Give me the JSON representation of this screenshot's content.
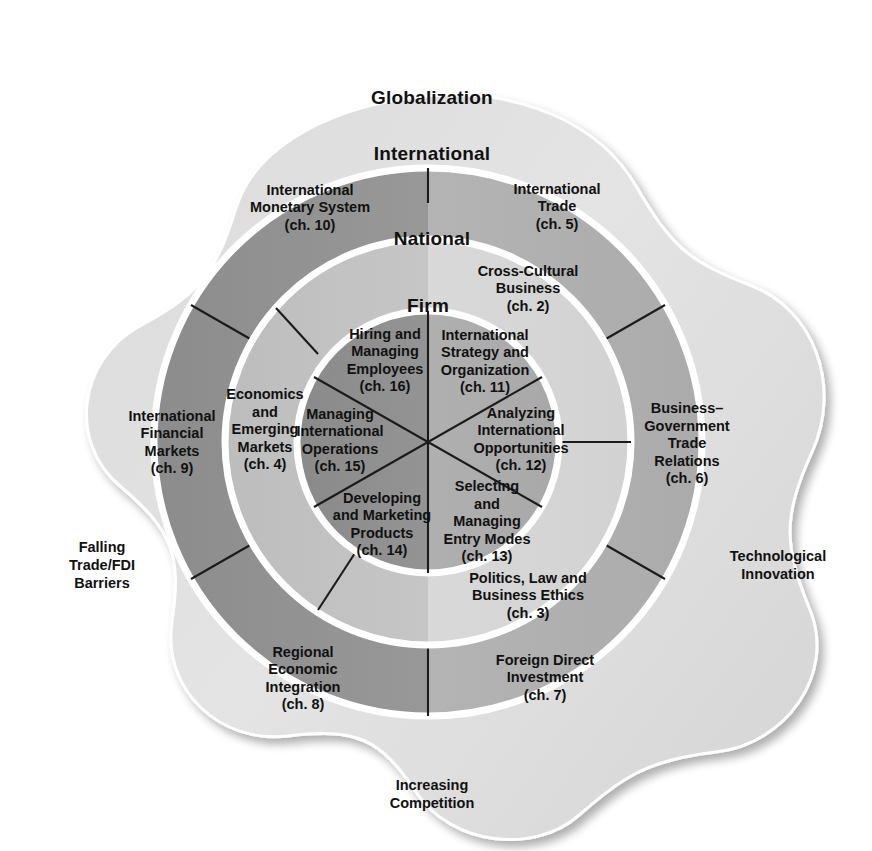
{
  "diagram": {
    "center": {
      "x": 428,
      "y": 442
    },
    "colors": {
      "background": "#ffffff",
      "outer_blob_light": "#e2e2e2",
      "outer_blob_dark": "#d2d2d2",
      "international_light": "#b6b6b6",
      "international_dark": "#8f8f8f",
      "national_light": "#d8d8d8",
      "national_dark": "#b9b9b9",
      "firm_light": "#b0b0b0",
      "firm_dark": "#8b8b8b",
      "divider": "#1b1b1b",
      "ring_edge": "#ffffff",
      "text": "#111111"
    },
    "radii": {
      "firm": 131,
      "national": 203,
      "international": 274,
      "blob": 345
    }
  },
  "ring_titles": [
    {
      "id": "globalization",
      "label": "Globalization",
      "x": 432,
      "y": 99
    },
    {
      "id": "international",
      "label": "International",
      "x": 432,
      "y": 155
    },
    {
      "id": "national",
      "label": "National",
      "x": 432,
      "y": 240
    },
    {
      "id": "firm",
      "label": "Firm",
      "x": 428,
      "y": 307
    }
  ],
  "outer_labels": [
    {
      "id": "falling-trade-fdi-barriers",
      "lines": [
        "Falling",
        "Trade/FDI",
        "Barriers"
      ],
      "x": 102,
      "y": 566
    },
    {
      "id": "technological-innovation",
      "lines": [
        "Technological",
        "Innovation"
      ],
      "x": 778,
      "y": 566
    },
    {
      "id": "increasing-competition",
      "lines": [
        "Increasing",
        "Competition"
      ],
      "x": 432,
      "y": 795
    }
  ],
  "rings": [
    {
      "id": "international-ring",
      "name": "International",
      "segments": [
        {
          "id": "international-monetary-system",
          "lines": [
            "International",
            "Monetary System",
            "(ch. 10)"
          ],
          "chapter": "ch. 10",
          "x": 310,
          "y": 208
        },
        {
          "id": "international-trade",
          "lines": [
            "International",
            "Trade",
            "(ch. 5)"
          ],
          "chapter": "ch. 5",
          "x": 557,
          "y": 207
        },
        {
          "id": "international-financial-markets",
          "lines": [
            "International",
            "Financial",
            "Markets",
            "(ch. 9)"
          ],
          "chapter": "ch. 9",
          "x": 172,
          "y": 443
        },
        {
          "id": "business-government-trade-relations",
          "lines": [
            "Business–",
            "Government",
            "Trade",
            "Relations",
            "(ch. 6)"
          ],
          "chapter": "ch. 6",
          "x": 687,
          "y": 444
        },
        {
          "id": "regional-economic-integration",
          "lines": [
            "Regional",
            "Economic",
            "Integration",
            "(ch. 8)"
          ],
          "chapter": "ch. 8",
          "x": 303,
          "y": 679
        },
        {
          "id": "foreign-direct-investment",
          "lines": [
            "Foreign Direct",
            "Investment",
            "(ch. 7)"
          ],
          "chapter": "ch. 7",
          "x": 545,
          "y": 678
        }
      ]
    },
    {
      "id": "national-ring",
      "name": "National",
      "segments": [
        {
          "id": "cross-cultural-business",
          "lines": [
            "Cross-Cultural",
            "Business",
            "(ch. 2)"
          ],
          "chapter": "ch. 2",
          "x": 528,
          "y": 289
        },
        {
          "id": "economics-and-emerging-markets",
          "lines": [
            "Economics",
            "and",
            "Emerging",
            "Markets",
            "(ch. 4)"
          ],
          "chapter": "ch. 4",
          "x": 265,
          "y": 430
        },
        {
          "id": "politics-law-and-business-ethics",
          "lines": [
            "Politics, Law and",
            "Business Ethics",
            "(ch. 3)"
          ],
          "chapter": "ch. 3",
          "x": 528,
          "y": 596
        }
      ]
    },
    {
      "id": "firm-ring",
      "name": "Firm",
      "segments": [
        {
          "id": "hiring-and-managing-employees",
          "lines": [
            "Hiring and",
            "Managing",
            "Employees",
            "(ch. 16)"
          ],
          "chapter": "ch. 16",
          "x": 385,
          "y": 361
        },
        {
          "id": "international-strategy-and-organization",
          "lines": [
            "International",
            "Strategy and",
            "Organization",
            "(ch. 11)"
          ],
          "chapter": "ch. 11",
          "x": 485,
          "y": 362
        },
        {
          "id": "managing-international-operations",
          "lines": [
            "Managing",
            "International",
            "Operations",
            "(ch. 15)"
          ],
          "chapter": "ch. 15",
          "x": 340,
          "y": 441
        },
        {
          "id": "analyzing-international-opportunities",
          "lines": [
            "Analyzing",
            "International",
            "Opportunities",
            "(ch. 12)"
          ],
          "chapter": "ch. 12",
          "x": 521,
          "y": 440
        },
        {
          "id": "developing-and-marketing-products",
          "lines": [
            "Developing",
            "and Marketing",
            "Products",
            "(ch. 14)"
          ],
          "chapter": "ch. 14",
          "x": 382,
          "y": 525
        },
        {
          "id": "selecting-and-managing-entry-modes",
          "lines": [
            "Selecting",
            "and",
            "Managing",
            "Entry Modes",
            "(ch. 13)"
          ],
          "chapter": "ch. 13",
          "x": 487,
          "y": 522
        }
      ]
    }
  ]
}
